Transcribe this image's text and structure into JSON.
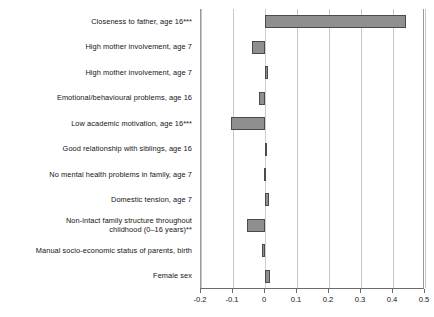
{
  "chart_data": {
    "type": "bar",
    "orientation": "horizontal",
    "title": "",
    "xlabel": "",
    "ylabel": "",
    "xlim": [
      -0.2,
      0.5
    ],
    "grid": true,
    "legend": null,
    "bar_color": "#8f8f8f",
    "bar_edge_color": "#4b4b4b",
    "xticks": [
      -0.2,
      -0.1,
      0,
      0.1,
      0.2,
      0.3,
      0.4,
      0.5
    ],
    "xtick_labels": [
      "-0.2",
      "-0.1",
      "0",
      "0.1",
      "0.2",
      "0.3",
      "0.4",
      "0.5"
    ],
    "categories": [
      "Closeness to father, age 16***",
      "High mother involvement, age 7",
      "High mother involvement, age 7",
      "Emotional/behavioural problems, age 16",
      "Low academic motivation, age 16***",
      "Good relationship with siblings, age 16",
      "No mental health problems in family, age 7",
      "Domestic tension, age 7",
      "Non-intact family structure throughout\nchildhood (0–16 years)**",
      "Manual socio-economic status of parents, birth",
      "Female sex"
    ],
    "values": [
      0.44,
      -0.042,
      0.008,
      -0.018,
      -0.105,
      0.004,
      -0.004,
      0.012,
      -0.055,
      -0.009,
      0.017
    ]
  }
}
